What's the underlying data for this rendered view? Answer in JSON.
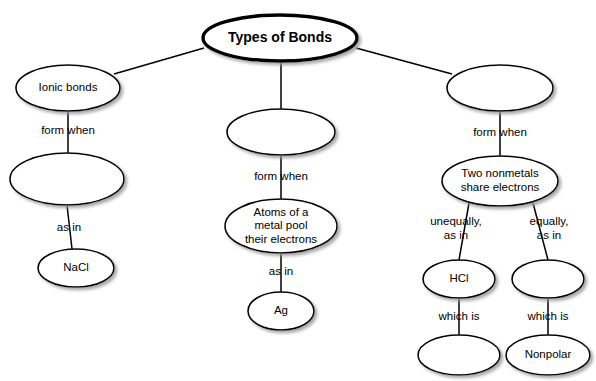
{
  "diagram": {
    "title": "Types of Bonds",
    "type": "concept-map",
    "nodes": [
      {
        "id": "root",
        "label": "Types of Bonds",
        "lines": [
          "Types of Bonds"
        ],
        "cx": 280,
        "cy": 38,
        "rx": 77,
        "ry": 23,
        "root": true
      },
      {
        "id": "ionic",
        "label": "Ionic bonds",
        "lines": [
          "Ionic bonds"
        ],
        "cx": 68,
        "cy": 88,
        "rx": 52,
        "ry": 23,
        "root": false
      },
      {
        "id": "ionic-blank",
        "label": "",
        "lines": [],
        "cx": 67,
        "cy": 179,
        "rx": 57,
        "ry": 26,
        "root": false
      },
      {
        "id": "nacl",
        "label": "NaCl",
        "lines": [
          "NaCl"
        ],
        "cx": 76,
        "cy": 268,
        "rx": 38,
        "ry": 19,
        "root": false
      },
      {
        "id": "metallic-blank",
        "label": "",
        "lines": [],
        "cx": 281,
        "cy": 132,
        "rx": 54,
        "ry": 23,
        "root": false
      },
      {
        "id": "metal-pool",
        "label": "Atoms of a metal pool their electrons",
        "lines": [
          "Atoms of a",
          "metal pool",
          "their electrons"
        ],
        "cx": 281,
        "cy": 226,
        "rx": 56,
        "ry": 27,
        "root": false
      },
      {
        "id": "ag",
        "label": "Ag",
        "lines": [
          "Ag"
        ],
        "cx": 281,
        "cy": 311,
        "rx": 33,
        "ry": 19,
        "root": false
      },
      {
        "id": "covalent-blank",
        "label": "",
        "lines": [],
        "cx": 500,
        "cy": 88,
        "rx": 53,
        "ry": 23,
        "root": false
      },
      {
        "id": "two-nonmetals",
        "label": "Two nonmetals share electrons",
        "lines": [
          "Two nonmetals",
          "share electrons"
        ],
        "cx": 500,
        "cy": 181,
        "rx": 58,
        "ry": 25,
        "root": false
      },
      {
        "id": "hcl",
        "label": "HCl",
        "lines": [
          "HCl"
        ],
        "cx": 459,
        "cy": 279,
        "rx": 36,
        "ry": 19,
        "root": false
      },
      {
        "id": "equal-blank",
        "label": "",
        "lines": [],
        "cx": 548,
        "cy": 279,
        "rx": 36,
        "ry": 19,
        "root": false
      },
      {
        "id": "polar-blank",
        "label": "",
        "lines": [],
        "cx": 459,
        "cy": 355,
        "rx": 41,
        "ry": 20,
        "root": false
      },
      {
        "id": "nonpolar",
        "label": "Nonpolar",
        "lines": [
          "Nonpolar"
        ],
        "cx": 548,
        "cy": 355,
        "rx": 42,
        "ry": 20,
        "root": false
      }
    ],
    "edges": [
      {
        "id": "root-ionic",
        "from": "root",
        "to": "ionic",
        "x1": 204,
        "y1": 48,
        "x2": 114,
        "y2": 74,
        "label": ""
      },
      {
        "id": "root-metallic",
        "from": "root",
        "to": "metallic-blank",
        "x1": 281,
        "y1": 61,
        "x2": 281,
        "y2": 109,
        "label": ""
      },
      {
        "id": "root-covalent",
        "from": "root",
        "to": "covalent-blank",
        "x1": 356,
        "y1": 48,
        "x2": 452,
        "y2": 74,
        "label": ""
      },
      {
        "id": "ionic-blank-edge",
        "from": "ionic",
        "to": "ionic-blank",
        "x1": 68,
        "y1": 111,
        "x2": 68,
        "y2": 153,
        "label": "form when"
      },
      {
        "id": "ionic-nacl",
        "from": "ionic-blank",
        "to": "nacl",
        "x1": 67,
        "y1": 205,
        "x2": 72,
        "y2": 249,
        "label": "as in"
      },
      {
        "id": "metallic-pool",
        "from": "metallic-blank",
        "to": "metal-pool",
        "x1": 281,
        "y1": 155,
        "x2": 281,
        "y2": 199,
        "label": "form when"
      },
      {
        "id": "pool-ag",
        "from": "metal-pool",
        "to": "ag",
        "x1": 281,
        "y1": 253,
        "x2": 281,
        "y2": 292,
        "label": "as in"
      },
      {
        "id": "covalent-two",
        "from": "covalent-blank",
        "to": "two-nonmetals",
        "x1": 500,
        "y1": 111,
        "x2": 500,
        "y2": 156,
        "label": "form when"
      },
      {
        "id": "two-hcl",
        "from": "two-nonmetals",
        "to": "hcl",
        "x1": 469,
        "y1": 203,
        "x2": 459,
        "y2": 260,
        "label": "unequally, as in"
      },
      {
        "id": "two-equal",
        "from": "two-nonmetals",
        "to": "equal-blank",
        "x1": 533,
        "y1": 203,
        "x2": 548,
        "y2": 260,
        "label": "equally, as in"
      },
      {
        "id": "hcl-polar",
        "from": "hcl",
        "to": "polar-blank",
        "x1": 459,
        "y1": 298,
        "x2": 459,
        "y2": 335,
        "label": "which is"
      },
      {
        "id": "equal-nonpolar",
        "from": "equal-blank",
        "to": "nonpolar",
        "x1": 548,
        "y1": 298,
        "x2": 548,
        "y2": 335,
        "label": "which is"
      }
    ],
    "edge_labels": [
      {
        "id": "lbl-ionic-form",
        "text": "form when",
        "x": 68,
        "y": 131
      },
      {
        "id": "lbl-ionic-asin",
        "text": "as in",
        "x": 69,
        "y": 228
      },
      {
        "id": "lbl-metal-form",
        "text": "form when",
        "x": 281,
        "y": 177
      },
      {
        "id": "lbl-metal-asin",
        "text": "as in",
        "x": 281,
        "y": 272
      },
      {
        "id": "lbl-cov-form",
        "text": "form when",
        "x": 500,
        "y": 133
      },
      {
        "id": "lbl-unequally-1",
        "text": "unequally,",
        "x": 456,
        "y": 222
      },
      {
        "id": "lbl-unequally-2",
        "text": "as in",
        "x": 456,
        "y": 236
      },
      {
        "id": "lbl-equally-1",
        "text": "equally,",
        "x": 549,
        "y": 222
      },
      {
        "id": "lbl-equally-2",
        "text": "as in",
        "x": 549,
        "y": 236
      },
      {
        "id": "lbl-whichis-left",
        "text": "which is",
        "x": 459,
        "y": 317
      },
      {
        "id": "lbl-whichis-right",
        "text": "which is",
        "x": 548,
        "y": 317
      }
    ],
    "colors": {
      "background": "#ffffff",
      "stroke": "#000000",
      "text": "#000000",
      "node_fill": "#ffffff",
      "shadow": "#b0b0b0"
    }
  }
}
